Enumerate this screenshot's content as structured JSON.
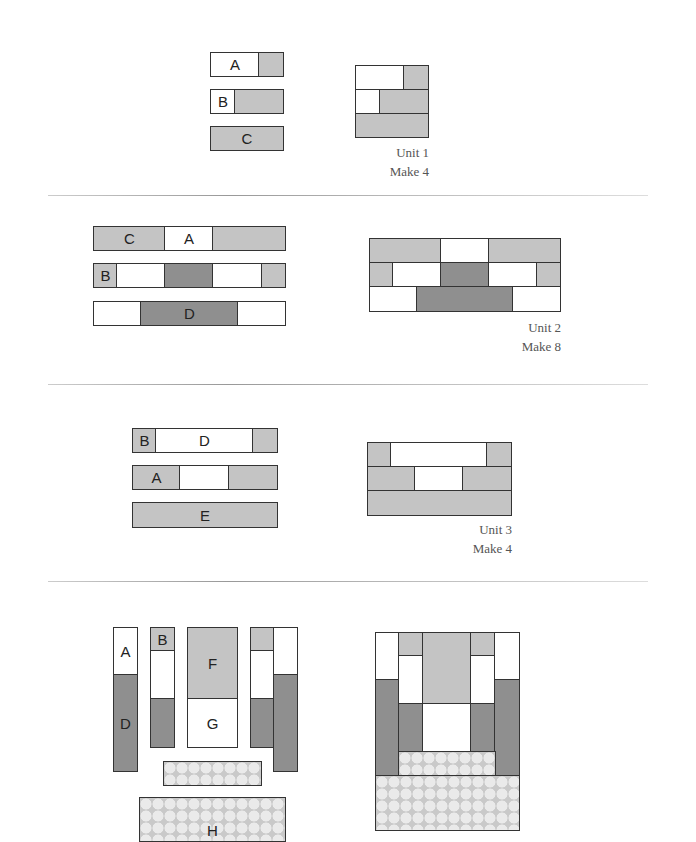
{
  "colors": {
    "light": "#c4c4c4",
    "dark": "#8f8f8f",
    "white": "#ffffff",
    "border": "#333333"
  },
  "units": [
    {
      "caption": "Unit 1",
      "make": "Make 4",
      "labels": {
        "a": "A",
        "b": "B",
        "c": "C"
      }
    },
    {
      "caption": "Unit 2",
      "make": "Make 8",
      "labels": {
        "c": "C",
        "a": "A",
        "b": "B",
        "d": "D"
      }
    },
    {
      "caption": "Unit 3",
      "make": "Make 4",
      "labels": {
        "b": "B",
        "d": "D",
        "a": "A",
        "e": "E"
      }
    },
    {
      "labels": {
        "a": "A",
        "b": "B",
        "d": "D",
        "f": "F",
        "g": "G",
        "h": "H"
      }
    }
  ]
}
